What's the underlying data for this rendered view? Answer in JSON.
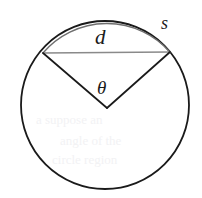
{
  "figure": {
    "canvas": {
      "width": 202,
      "height": 198,
      "background": "#ffffff"
    },
    "labels": {
      "chord": "d",
      "arc": "s",
      "angle": "θ"
    },
    "colors": {
      "circle_stroke": "#1a1a1a",
      "arc_stroke": "#6e6e6e",
      "chord_stroke": "#8a8a8a",
      "radius_stroke": "#1a1a1a",
      "label_text": "#1a1a1a",
      "background": "#ffffff",
      "bleed_through": "#f2f2f4"
    },
    "geometry": {
      "center_x": 105,
      "center_y": 105,
      "radius": 84,
      "apex_x": 107,
      "apex_y": 108,
      "chord_left_x": 43,
      "chord_left_y": 53,
      "chord_right_x": 170,
      "chord_right_y": 52,
      "circle_stroke_width": 1.8,
      "arc_stroke_width": 1.3,
      "chord_stroke_width": 1.4,
      "radius_stroke_width": 1.6
    },
    "bleed_artifacts": [
      {
        "text": "a suppose an",
        "left": 36,
        "top": 112,
        "size": 13
      },
      {
        "text": "angle of the",
        "left": 60,
        "top": 133,
        "size": 13
      },
      {
        "text": "circle region",
        "left": 52,
        "top": 152,
        "size": 13
      }
    ]
  }
}
